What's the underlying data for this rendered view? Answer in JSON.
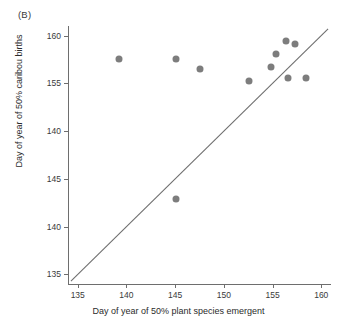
{
  "figure": {
    "panel_label": "(B)",
    "point_color": "#7d7d7d",
    "line_color": "#6e6e6e",
    "axis_color": "#6e6e6e"
  },
  "chart_data": {
    "type": "scatter",
    "title": "(B)",
    "xlabel": "Day of year of 50% plant species emergent",
    "ylabel": "Day of year of 50% caribou births",
    "xlim": [
      134,
      161
    ],
    "ylim": [
      134,
      161
    ],
    "grid": false,
    "legend": null,
    "xticks": [
      135,
      140,
      145,
      150,
      155,
      160
    ],
    "yticks": [
      135,
      140,
      145,
      150,
      155,
      160
    ],
    "xtick_labels": [
      "135",
      "140",
      "145",
      "150",
      "155",
      "160"
    ],
    "ytick_labels": [
      "135",
      "140",
      "145",
      "140",
      "155",
      "160"
    ],
    "points": [
      {
        "x": 139.2,
        "y": 157.5
      },
      {
        "x": 145.1,
        "y": 157.5
      },
      {
        "x": 145.1,
        "y": 142.9
      },
      {
        "x": 147.5,
        "y": 156.5
      },
      {
        "x": 152.6,
        "y": 155.2
      },
      {
        "x": 154.8,
        "y": 156.7
      },
      {
        "x": 155.4,
        "y": 158.1
      },
      {
        "x": 156.4,
        "y": 159.4
      },
      {
        "x": 157.3,
        "y": 159.1
      },
      {
        "x": 156.6,
        "y": 155.6
      },
      {
        "x": 158.4,
        "y": 155.6
      }
    ],
    "annotations": [
      {
        "type": "line",
        "label": "1:1 reference line",
        "x": [
          134.3,
          160.7
        ],
        "y": [
          134.3,
          160.7
        ]
      }
    ]
  },
  "axis": {
    "x_ticks": [
      {
        "label": "135",
        "value": 135
      },
      {
        "label": "140",
        "value": 140
      },
      {
        "label": "145",
        "value": 145
      },
      {
        "label": "150",
        "value": 150
      },
      {
        "label": "155",
        "value": 155
      },
      {
        "label": "160",
        "value": 160
      }
    ],
    "y_ticks": [
      {
        "label": "135",
        "value": 135
      },
      {
        "label": "140",
        "value": 140
      },
      {
        "label": "145",
        "value": 145
      },
      {
        "label": "140",
        "value": 150
      },
      {
        "label": "155",
        "value": 155
      },
      {
        "label": "160",
        "value": 160
      }
    ]
  }
}
